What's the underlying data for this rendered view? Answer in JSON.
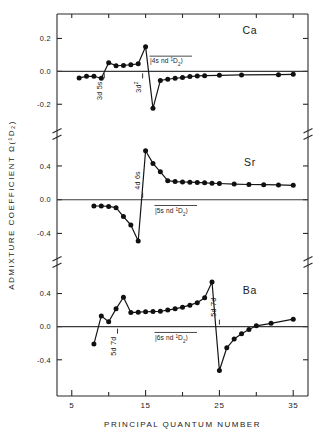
{
  "figure": {
    "y_axis_title": "ADMIXTURE  COEFFICIENT  Ω(¹D₂)",
    "x_axis_title": "PRINCIPAL   QUANTUM   NUMBER",
    "x_tick_labels": [
      "5",
      "15",
      "25",
      "35"
    ],
    "x_ticks_major": [
      5,
      15,
      25,
      35
    ],
    "x_ticks_minor": [
      10,
      20,
      30
    ],
    "xlim": [
      3,
      37
    ],
    "ink_color": "#151515",
    "frame_color": "#2b2b2b"
  },
  "panels": [
    {
      "id": "ca",
      "element_label": "Ca",
      "state_label_prefix": "|4s nd ",
      "state_label_term": "1",
      "state_label_D": "D",
      "state_label_J": "2",
      "state_label_suffix": "⟩",
      "y_tick_labels": [
        "0.2",
        "0.0",
        "-0.2"
      ],
      "y_ticks": [
        0.2,
        0.0,
        -0.2
      ],
      "ylim": [
        -0.32,
        0.3
      ],
      "annotations": [
        {
          "text": "3d 5s",
          "n": 9.4
        },
        {
          "text": "3d",
          "sup": "2",
          "n": 14.6
        }
      ]
    },
    {
      "id": "sr",
      "element_label": "Sr",
      "state_label_prefix": "|5s nd ",
      "state_label_term": "1",
      "state_label_D": "D",
      "state_label_J": "2",
      "state_label_suffix": "⟩",
      "y_tick_labels": [
        "0.4",
        "0.0",
        "-0.4"
      ],
      "y_ticks": [
        0.4,
        0.0,
        -0.4
      ],
      "ylim": [
        -0.62,
        0.66
      ],
      "annotations": [
        {
          "text": "4d 6s",
          "n": 14.6
        }
      ]
    },
    {
      "id": "ba",
      "element_label": "Ba",
      "state_label_prefix": "|6s nd ",
      "state_label_term": "1",
      "state_label_D": "D",
      "state_label_J": "2",
      "state_label_suffix": "⟩",
      "y_tick_labels": [
        "0.4",
        "0.0",
        "-0.4"
      ],
      "y_ticks": [
        0.4,
        0.0,
        -0.4
      ],
      "ylim": [
        -0.62,
        0.66
      ],
      "annotations": [
        {
          "text": "5d 7d",
          "n": 11.2
        },
        {
          "text": "5d 7d",
          "n": 25.0
        }
      ]
    }
  ],
  "chart_data": {
    "type": "line",
    "title": "",
    "xlabel": "PRINCIPAL   QUANTUM   NUMBER",
    "ylabel": "ADMIXTURE  COEFFICIENT  Ω(¹D₂)",
    "xlim": [
      3,
      37
    ],
    "grid": false,
    "legend": "none",
    "panels": [
      {
        "name": "Ca",
        "ylabel_ticks": [
          0.2,
          0.0,
          -0.2
        ],
        "ylim": [
          -0.32,
          0.3
        ],
        "x": [
          6,
          7,
          8,
          9,
          10,
          11,
          12,
          13,
          14,
          15,
          16,
          17,
          18,
          19,
          20,
          21,
          22,
          23,
          25,
          28,
          33,
          35
        ],
        "y": [
          -0.04,
          -0.03,
          -0.03,
          -0.042,
          0.053,
          0.034,
          0.036,
          0.04,
          0.046,
          0.15,
          -0.225,
          -0.055,
          -0.048,
          -0.042,
          -0.038,
          -0.032,
          -0.028,
          -0.026,
          -0.024,
          -0.022,
          -0.02,
          -0.018
        ]
      },
      {
        "name": "Sr",
        "ylabel_ticks": [
          0.4,
          0.0,
          -0.4
        ],
        "ylim": [
          -0.62,
          0.66
        ],
        "x": [
          8,
          9,
          10,
          11,
          12,
          13,
          14,
          15,
          16,
          17,
          18,
          19,
          20,
          21,
          22,
          23,
          24,
          25,
          27,
          29,
          31,
          33,
          35
        ],
        "y": [
          -0.075,
          -0.075,
          -0.08,
          -0.095,
          -0.2,
          -0.3,
          -0.49,
          0.58,
          0.43,
          0.33,
          0.225,
          0.215,
          0.21,
          0.208,
          0.205,
          0.2,
          0.195,
          0.192,
          0.185,
          0.18,
          0.178,
          0.175,
          0.17
        ]
      },
      {
        "name": "Ba",
        "ylabel_ticks": [
          0.4,
          0.0,
          -0.4
        ],
        "ylim": [
          -0.62,
          0.66
        ],
        "x": [
          8,
          9,
          10,
          11,
          12,
          13,
          14,
          15,
          16,
          17,
          18,
          19,
          20,
          21,
          22,
          23,
          24,
          25,
          26,
          27,
          28,
          29,
          30,
          32,
          35
        ],
        "y": [
          -0.21,
          0.13,
          0.06,
          0.215,
          0.355,
          0.17,
          0.175,
          0.18,
          0.182,
          0.186,
          0.2,
          0.215,
          0.235,
          0.26,
          0.29,
          0.35,
          0.54,
          -0.53,
          -0.255,
          -0.15,
          -0.085,
          -0.035,
          0.01,
          0.04,
          0.09
        ]
      }
    ]
  }
}
